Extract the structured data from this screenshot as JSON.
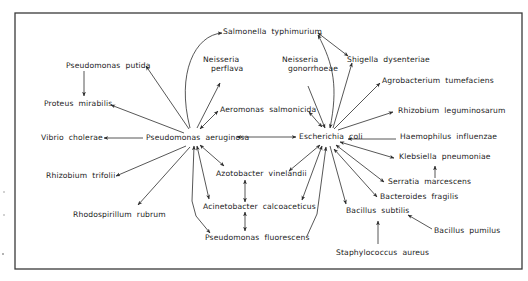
{
  "diagram": {
    "type": "bacterial relationship network",
    "colors": {
      "ink": "#2c2c2c",
      "text": "#222222",
      "background": "#ffffff"
    },
    "nodes": [
      {
        "id": "salmonella",
        "genus": "Salmonella",
        "species": "typhimurium"
      },
      {
        "id": "shigella",
        "genus": "Shigella",
        "species": "dysenteriae"
      },
      {
        "id": "ps_putida",
        "genus": "Pseudomonas",
        "species": "putida"
      },
      {
        "id": "n_perflava",
        "genus": "Neisseria",
        "species": "perflava"
      },
      {
        "id": "n_gonorrhoeae",
        "genus": "Neisseria",
        "species": "gonorrhoeae"
      },
      {
        "id": "agrobacterium",
        "genus": "Agrobacterium",
        "species": "tumefaciens"
      },
      {
        "id": "proteus",
        "genus": "Proteus",
        "species": "mirabilis"
      },
      {
        "id": "aeromonas",
        "genus": "Aeromonas",
        "species": "salmonicida"
      },
      {
        "id": "rh_leguminosarum",
        "genus": "Rhizobium",
        "species": "leguminosarum"
      },
      {
        "id": "vibrio",
        "genus": "Vibrio",
        "species": "cholerae"
      },
      {
        "id": "ps_aeruginosa",
        "genus": "Pseudomonas",
        "species": "aeruginosa"
      },
      {
        "id": "ecoli",
        "genus": "Escherichia",
        "species": "coli"
      },
      {
        "id": "haemophilus",
        "genus": "Haemophilus",
        "species": "influenzae"
      },
      {
        "id": "azotobacter",
        "genus": "Azotobacter",
        "species": "vinelandii"
      },
      {
        "id": "klebsiella",
        "genus": "Klebsiella",
        "species": "pneumoniae"
      },
      {
        "id": "rh_trifolii",
        "genus": "Rhizobium",
        "species": "trifolii"
      },
      {
        "id": "serratia",
        "genus": "Serratia",
        "species": "marcescens"
      },
      {
        "id": "acinetobacter",
        "genus": "Acinetobacter",
        "species": "calcoaceticus"
      },
      {
        "id": "bacteroides",
        "genus": "Bacteroides",
        "species": "fragilis"
      },
      {
        "id": "rhodospirillum",
        "genus": "Rhodospirillum",
        "species": "rubrum"
      },
      {
        "id": "b_subtilis",
        "genus": "Bacillus",
        "species": "subtilis"
      },
      {
        "id": "b_pumilus",
        "genus": "Bacillus",
        "species": "pumilus"
      },
      {
        "id": "ps_fluorescens",
        "genus": "Pseudomonas",
        "species": "fluorescens"
      },
      {
        "id": "staph",
        "genus": "Staphylococcus",
        "species": "aureus"
      }
    ],
    "edges": [
      {
        "from": "ps_aeruginosa",
        "to": "salmonella",
        "direction": "forward",
        "curve": "arc-up"
      },
      {
        "from": "ps_aeruginosa",
        "to": "ps_putida",
        "direction": "forward"
      },
      {
        "from": "ps_putida",
        "to": "proteus",
        "direction": "forward"
      },
      {
        "from": "ps_aeruginosa",
        "to": "proteus",
        "direction": "forward"
      },
      {
        "from": "ps_aeruginosa",
        "to": "n_perflava",
        "direction": "forward"
      },
      {
        "from": "ps_aeruginosa",
        "to": "aeromonas",
        "direction": "both"
      },
      {
        "from": "ps_aeruginosa",
        "to": "vibrio",
        "direction": "forward"
      },
      {
        "from": "ps_aeruginosa",
        "to": "ecoli",
        "direction": "both"
      },
      {
        "from": "ps_aeruginosa",
        "to": "rh_trifolii",
        "direction": "forward"
      },
      {
        "from": "ps_aeruginosa",
        "to": "rhodospirillum",
        "direction": "forward"
      },
      {
        "from": "ps_aeruginosa",
        "to": "azotobacter",
        "direction": "both"
      },
      {
        "from": "ps_aeruginosa",
        "to": "acinetobacter",
        "direction": "both"
      },
      {
        "from": "ps_aeruginosa",
        "to": "ps_fluorescens",
        "direction": "both",
        "curve": "bend-left"
      },
      {
        "from": "azotobacter",
        "to": "acinetobacter",
        "direction": "both"
      },
      {
        "from": "acinetobacter",
        "to": "ps_fluorescens",
        "direction": "both"
      },
      {
        "from": "ecoli",
        "to": "salmonella",
        "direction": "both",
        "curve": "arc-right"
      },
      {
        "from": "salmonella",
        "to": "shigella",
        "direction": "both"
      },
      {
        "from": "ecoli",
        "to": "shigella",
        "direction": "forward"
      },
      {
        "from": "n_gonorrhoeae",
        "to": "ecoli",
        "direction": "forward"
      },
      {
        "from": "aeromonas",
        "to": "ecoli",
        "direction": "both"
      },
      {
        "from": "ecoli",
        "to": "agrobacterium",
        "direction": "forward"
      },
      {
        "from": "ecoli",
        "to": "rh_leguminosarum",
        "direction": "forward"
      },
      {
        "from": "haemophilus",
        "to": "ecoli",
        "direction": "forward"
      },
      {
        "from": "ecoli",
        "to": "klebsiella",
        "direction": "both"
      },
      {
        "from": "ecoli",
        "to": "serratia",
        "direction": "both"
      },
      {
        "from": "ecoli",
        "to": "bacteroides",
        "direction": "both"
      },
      {
        "from": "ecoli",
        "to": "azotobacter",
        "direction": "both"
      },
      {
        "from": "ecoli",
        "to": "acinetobacter",
        "direction": "both"
      },
      {
        "from": "ps_fluorescens",
        "to": "ecoli",
        "direction": "forward",
        "curve": "bend-right"
      },
      {
        "from": "ecoli",
        "to": "b_subtilis",
        "direction": "forward"
      },
      {
        "from": "serratia",
        "to": "klebsiella",
        "direction": "forward"
      },
      {
        "from": "b_pumilus",
        "to": "b_subtilis",
        "direction": "forward"
      },
      {
        "from": "staph",
        "to": "b_subtilis",
        "direction": "forward"
      }
    ]
  }
}
